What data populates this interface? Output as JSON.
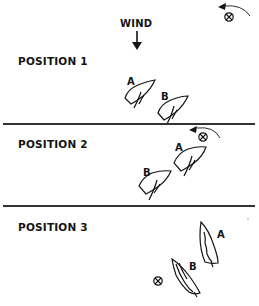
{
  "wind": {
    "label": "WIND"
  },
  "positions": [
    {
      "label": "POSITION 1",
      "boats": [
        {
          "id": "A"
        },
        {
          "id": "B"
        }
      ]
    },
    {
      "label": "POSITION 2",
      "boats": [
        {
          "id": "A"
        },
        {
          "id": "B"
        }
      ]
    },
    {
      "label": "POSITION 3",
      "boats": [
        {
          "id": "A"
        },
        {
          "id": "B"
        }
      ]
    }
  ],
  "colors": {
    "ink": "#141414",
    "background": "#ffffff",
    "divider": "#333333"
  }
}
